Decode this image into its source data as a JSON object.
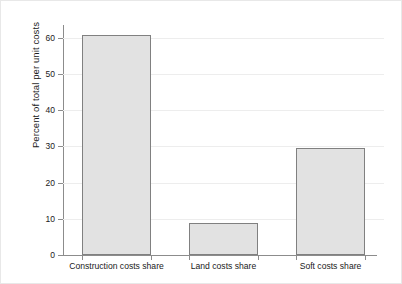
{
  "chart_data": {
    "type": "bar",
    "title": "",
    "xlabel": "",
    "ylabel": "Percent of total per unit costs",
    "categories": [
      "Construction costs share",
      "Land costs share",
      "Soft costs share"
    ],
    "values": [
      60.8,
      8.7,
      29.5
    ],
    "ylim": [
      0,
      63.5
    ],
    "yticks": [
      0,
      10,
      20,
      30,
      40,
      50,
      60
    ],
    "ytick_labels": [
      "0",
      "10",
      "20",
      "30",
      "40",
      "50",
      "60"
    ],
    "grid": "horizontal",
    "legend": "none",
    "bar_fill": "#e2e2e2",
    "bar_edge": "#808080",
    "axis_color": "#8c8c8c",
    "grid_color": "#ededed",
    "text_color": "#1a1a1a"
  }
}
